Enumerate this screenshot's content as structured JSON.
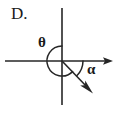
{
  "figure": {
    "panel_letter": "D.",
    "background_color": "#ffffff",
    "stroke_color": "#262626",
    "labels": {
      "theta": "θ",
      "alpha": "α"
    },
    "geometry": {
      "origin_x": 62,
      "origin_y": 61,
      "horizontal_axis_x_start": 5,
      "horizontal_axis_x_end": 113,
      "vertical_axis_y_start": 8,
      "vertical_axis_y_end": 105,
      "ray_end_x": 92,
      "ray_end_y": 92,
      "theta_arc_radius": 15,
      "alpha_arc_radius": 21
    },
    "elements": {
      "horizontal_axis": "horizontal-axis-with-right-arrowhead",
      "vertical_axis": "vertical-axis-line",
      "terminal_ray": "diagonal-ray-arrow-down-right",
      "theta_arc": "angle-arc-from-positive-y-axis-counterclockwise-to-ray",
      "alpha_arc": "angle-arc-from-positive-x-axis-clockwise-to-ray"
    }
  }
}
